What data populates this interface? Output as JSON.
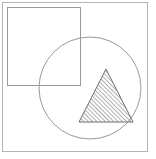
{
  "figure": {
    "title": "Geometric shapes figure",
    "canvas": {
      "width": 156,
      "height": 159
    },
    "background_color": "#ffffff",
    "line_color": "#9a9a9a",
    "frame_color": "#b4b4b4",
    "hatch_color": "#6e6e6e",
    "shapes": [
      {
        "name": "outer-frame",
        "type": "rectangle",
        "label": "Outer frame",
        "x": 2.5,
        "y": 2.5,
        "width": 145,
        "height": 149,
        "fill": "none",
        "stroke": "#b4b4b4",
        "stroke_width": 1
      },
      {
        "name": "square",
        "type": "rectangle",
        "label": "Square",
        "x": 7.5,
        "y": 7.5,
        "width": 73,
        "height": 78,
        "fill": "none",
        "stroke": "#9a9a9a",
        "stroke_width": 1
      },
      {
        "name": "circle",
        "type": "circle",
        "label": "Circle",
        "cx": 90,
        "cy": 88,
        "r": 51,
        "fill": "none",
        "stroke": "#9a9a9a",
        "stroke_width": 1
      },
      {
        "name": "triangle",
        "type": "polygon",
        "label": "Hatched triangle",
        "points": "106,69 133,122 79,122",
        "apex": {
          "x": 106,
          "y": 69
        },
        "base_left": {
          "x": 79,
          "y": 122
        },
        "base_right": {
          "x": 133,
          "y": 122
        },
        "fill": "hatch-pattern",
        "stroke": "#6e6e6e",
        "stroke_width": 1,
        "hatch": {
          "direction": "forward-slash",
          "angle_deg": 45,
          "spacing_px": 3,
          "line_width": 1,
          "color": "#6e6e6e"
        }
      }
    ]
  }
}
